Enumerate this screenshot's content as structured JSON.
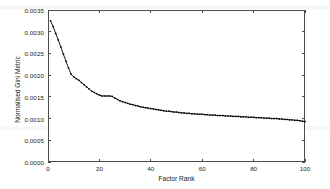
{
  "chart_data": {
    "type": "line",
    "title": "",
    "xlabel": "Factor Rank",
    "ylabel": "Normalised Gini Metric",
    "xlim": [
      0,
      100
    ],
    "ylim": [
      0.0,
      0.0035
    ],
    "grid": false,
    "legend": null,
    "marker": "square",
    "line_color": "#000000",
    "marker_color": "#000000",
    "xticks": [
      0,
      20,
      40,
      60,
      80,
      100
    ],
    "xtick_labels": [
      "0",
      "20",
      "40",
      "60",
      "80",
      "100"
    ],
    "yticks": [
      0.0,
      0.0005,
      0.001,
      0.0015,
      0.002,
      0.0025,
      0.003,
      0.0035
    ],
    "ytick_labels": [
      "0.0000",
      "0.0005",
      "0.0010",
      "0.0015",
      "0.0020",
      "0.0025",
      "0.0030",
      "0.0035"
    ],
    "series": [
      {
        "name": "Normalised Gini Metric",
        "x": [
          1,
          2,
          3,
          4,
          5,
          6,
          7,
          8,
          9,
          10,
          11,
          12,
          13,
          14,
          15,
          16,
          17,
          18,
          19,
          20,
          21,
          22,
          23,
          24,
          25,
          26,
          27,
          28,
          29,
          30,
          31,
          32,
          33,
          34,
          35,
          36,
          37,
          38,
          39,
          40,
          41,
          42,
          43,
          44,
          45,
          46,
          47,
          48,
          49,
          50,
          51,
          52,
          53,
          54,
          55,
          56,
          57,
          58,
          59,
          60,
          61,
          62,
          63,
          64,
          65,
          66,
          67,
          68,
          69,
          70,
          71,
          72,
          73,
          74,
          75,
          76,
          77,
          78,
          79,
          80,
          81,
          82,
          83,
          84,
          85,
          86,
          87,
          88,
          89,
          90,
          91,
          92,
          93,
          94,
          95,
          96,
          97,
          98,
          99,
          100
        ],
        "values": [
          0.00325,
          0.00312,
          0.00296,
          0.00281,
          0.00265,
          0.00248,
          0.00232,
          0.00216,
          0.00202,
          0.00196,
          0.00192,
          0.00188,
          0.00183,
          0.00178,
          0.00173,
          0.00168,
          0.00163,
          0.0016,
          0.00157,
          0.00154,
          0.00152,
          0.00152,
          0.00152,
          0.00152,
          0.00151,
          0.00147,
          0.00144,
          0.00141,
          0.00139,
          0.00137,
          0.00135,
          0.00133,
          0.00132,
          0.0013,
          0.00129,
          0.00127,
          0.00126,
          0.00125,
          0.00124,
          0.00123,
          0.00122,
          0.00121,
          0.0012,
          0.00119,
          0.00118,
          0.00117,
          0.00117,
          0.00116,
          0.00115,
          0.00115,
          0.00114,
          0.00113,
          0.00113,
          0.00112,
          0.00112,
          0.00111,
          0.00111,
          0.0011,
          0.0011,
          0.0011,
          0.00109,
          0.00109,
          0.00108,
          0.00108,
          0.00108,
          0.00107,
          0.00107,
          0.00107,
          0.00106,
          0.00106,
          0.00106,
          0.00105,
          0.00105,
          0.00105,
          0.00104,
          0.00104,
          0.00104,
          0.00103,
          0.00103,
          0.00103,
          0.00102,
          0.00102,
          0.00102,
          0.00101,
          0.00101,
          0.00101,
          0.001,
          0.001,
          0.001,
          0.00099,
          0.00099,
          0.00098,
          0.00098,
          0.00097,
          0.00097,
          0.00096,
          0.00096,
          0.00095,
          0.00094,
          0.00093
        ]
      }
    ]
  }
}
